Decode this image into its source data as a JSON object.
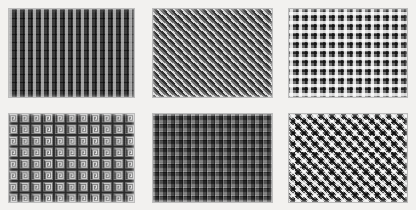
{
  "figure": {
    "title": "",
    "background_color": "#f2f1ef",
    "layout": {
      "rows": 2,
      "columns": 3,
      "panel_count": 6
    }
  },
  "panels": [
    {
      "id": "panel-1",
      "position": "top-left",
      "pattern_name": "square-lattice-blocks",
      "description": "Regular grid of light square blocks separated by dark channels",
      "dominant_colors": [
        "#3a3a3a",
        "#d5d5d5",
        "#6f6f6f"
      ],
      "tile_size_px": 8,
      "orientation": "orthogonal"
    },
    {
      "id": "panel-2",
      "position": "top-center",
      "pattern_name": "diagonal-herringbone-weave",
      "description": "Fine diagonal zigzag herringbone texture running at 45 degrees",
      "dominant_colors": [
        "#2e2e2e",
        "#d8d8d8",
        "#9a9a9a"
      ],
      "tile_size_px": 8,
      "orientation": "diagonal-45"
    },
    {
      "id": "panel-3",
      "position": "top-right",
      "pattern_name": "cross-plus-lattice",
      "description": "Array of light plus/cross motifs on a mid-grey lattice ground",
      "dominant_colors": [
        "#6e6e6e",
        "#f0f0f0",
        "#1a1a1a"
      ],
      "tile_size_px": 9,
      "orientation": "orthogonal"
    },
    {
      "id": "panel-4",
      "position": "bottom-left",
      "pattern_name": "greek-key-meander",
      "description": "Interlocking Greek key labyrinth meander fretwork",
      "dominant_colors": [
        "#7c7c7c",
        "#c9c9c9",
        "#2a2a2a"
      ],
      "tile_size_px": 12,
      "orientation": "orthogonal"
    },
    {
      "id": "panel-5",
      "position": "bottom-center",
      "pattern_name": "quilted-beveled-tiles",
      "description": "Grid of raised beveled square tiles with highlight and shadow edges",
      "dominant_colors": [
        "#5c5c5c",
        "#b8b8b8",
        "#1f1f1f"
      ],
      "tile_size_px": 8,
      "orientation": "orthogonal"
    },
    {
      "id": "panel-6",
      "position": "bottom-right",
      "pattern_name": "interlocking-cross-basketweave",
      "description": "Dense interlocking cross basket-weave of light and dark diagonals",
      "dominant_colors": [
        "#8c8c8c",
        "#efefef",
        "#151515"
      ],
      "tile_size_px": 11,
      "orientation": "diagonal-45"
    }
  ]
}
